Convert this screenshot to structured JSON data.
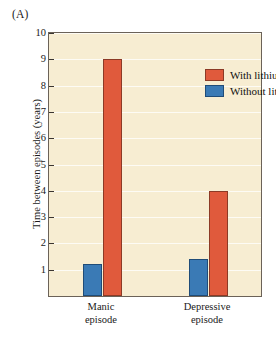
{
  "panel": {
    "label": "(A)"
  },
  "colors": {
    "with_lithium": "#e05a3c",
    "without_lithium": "#3a7ab5",
    "plot_background": "#f7edd2",
    "axis": "#3a3531",
    "gridline": "#ffffff",
    "page_background": "#ffffff"
  },
  "legend": {
    "position": "top-right-inside",
    "entries": [
      {
        "label": "With lithium",
        "color_key": "with_lithium",
        "icon": "legend-swatch-icon"
      },
      {
        "label": "Without lithium",
        "color_key": "without_lithium",
        "icon": "legend-swatch-icon"
      }
    ]
  },
  "axes": {
    "y": {
      "title": "Time between episodes (years)",
      "ticks": [
        1,
        2,
        3,
        4,
        5,
        6,
        7,
        8,
        9,
        10
      ],
      "tick_labels": [
        "1",
        "2",
        "3",
        "4",
        "5",
        "6",
        "7",
        "8",
        "9",
        "10"
      ],
      "min": 0,
      "max": 10
    },
    "x": {
      "title": "",
      "groups": [
        {
          "line1": "Manic",
          "line2": "episode"
        },
        {
          "line1": "Depressive",
          "line2": "episode"
        }
      ]
    }
  },
  "chart_data": {
    "type": "bar",
    "title": "",
    "subtitle": "",
    "xlabel": "",
    "ylabel": "Time between episodes (years)",
    "ylim": [
      0,
      10
    ],
    "yticks": [
      1,
      2,
      3,
      4,
      5,
      6,
      7,
      8,
      9,
      10
    ],
    "grid": true,
    "grid_axis": "y",
    "legend_position": "upper right",
    "categories": [
      "Manic episode",
      "Depressive episode"
    ],
    "series": [
      {
        "name": "Without lithium",
        "color": "#3a7ab5",
        "values": [
          1.2,
          1.4
        ]
      },
      {
        "name": "With lithium",
        "color": "#e05a3c",
        "values": [
          9.0,
          4.0
        ]
      }
    ],
    "bar_order_within_group": [
      "Without lithium",
      "With lithium"
    ],
    "annotations": [
      "(A)"
    ]
  }
}
